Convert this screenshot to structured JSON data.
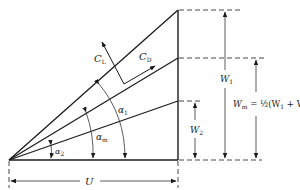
{
  "diagram": {
    "labels": {
      "cl": "C",
      "cl_sub": "L",
      "cd": "C",
      "cd_sub": "D",
      "alpha1": "α",
      "alpha1_sub": "1",
      "alpham": "α",
      "alpham_sub": "m",
      "alpha2": "α",
      "alpha2_sub": "2",
      "w1": "W",
      "w1_sub": "1",
      "w2": "W",
      "w2_sub": "2",
      "wm_equation": "W",
      "wm_sub": "m",
      "wm_rhs": " = ½(W",
      "wm_rhs_sub1": "1",
      "wm_rhs_mid": " + W",
      "wm_rhs_sub2": "2",
      "wm_rhs_end": ")",
      "u": "U"
    },
    "colors": {
      "ink": "#1a1a1a",
      "background": "#ffffff"
    }
  }
}
